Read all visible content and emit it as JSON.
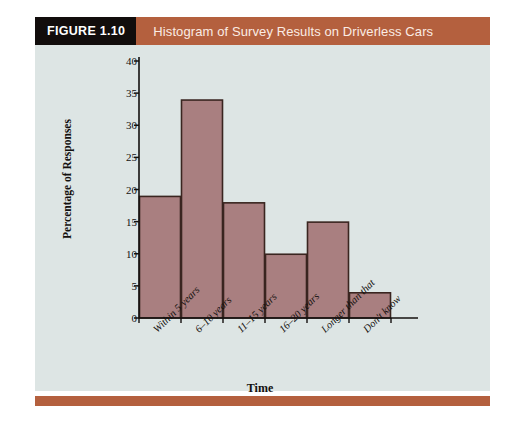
{
  "figure": {
    "badge": "FIGURE 1.10",
    "title": "Histogram of Survey Results on Driverless Cars"
  },
  "colors": {
    "header_bar": "#b4603e",
    "badge_bg": "#120d0c",
    "badge_text": "#ffffff",
    "panel_bg": "#dde5e4",
    "bar_fill": "#a97f80",
    "bar_stroke": "#3a2520",
    "axis": "#14110f",
    "bottom_rule": "#b4603e"
  },
  "chart_data": {
    "type": "bar",
    "title": "Histogram of Survey Results on Driverless Cars",
    "xlabel": "Time",
    "ylabel": "Percentage of Responses",
    "categories": [
      "Within 5 years",
      "6–10 years",
      "11–15 years",
      "16–20 years",
      "Longer than that",
      "Don't know"
    ],
    "values": [
      19,
      34,
      18,
      10,
      15,
      4
    ],
    "ylim": [
      0,
      40
    ],
    "ytick_values": [
      0,
      5,
      10,
      15,
      20,
      25,
      30,
      35,
      40
    ],
    "ytick_labels": [
      "0",
      "5",
      "10",
      "15",
      "20",
      "25",
      "30",
      "35",
      "40"
    ],
    "grid": false,
    "legend": null,
    "bars_contiguous": true,
    "xtick_label_rotation": -45
  }
}
